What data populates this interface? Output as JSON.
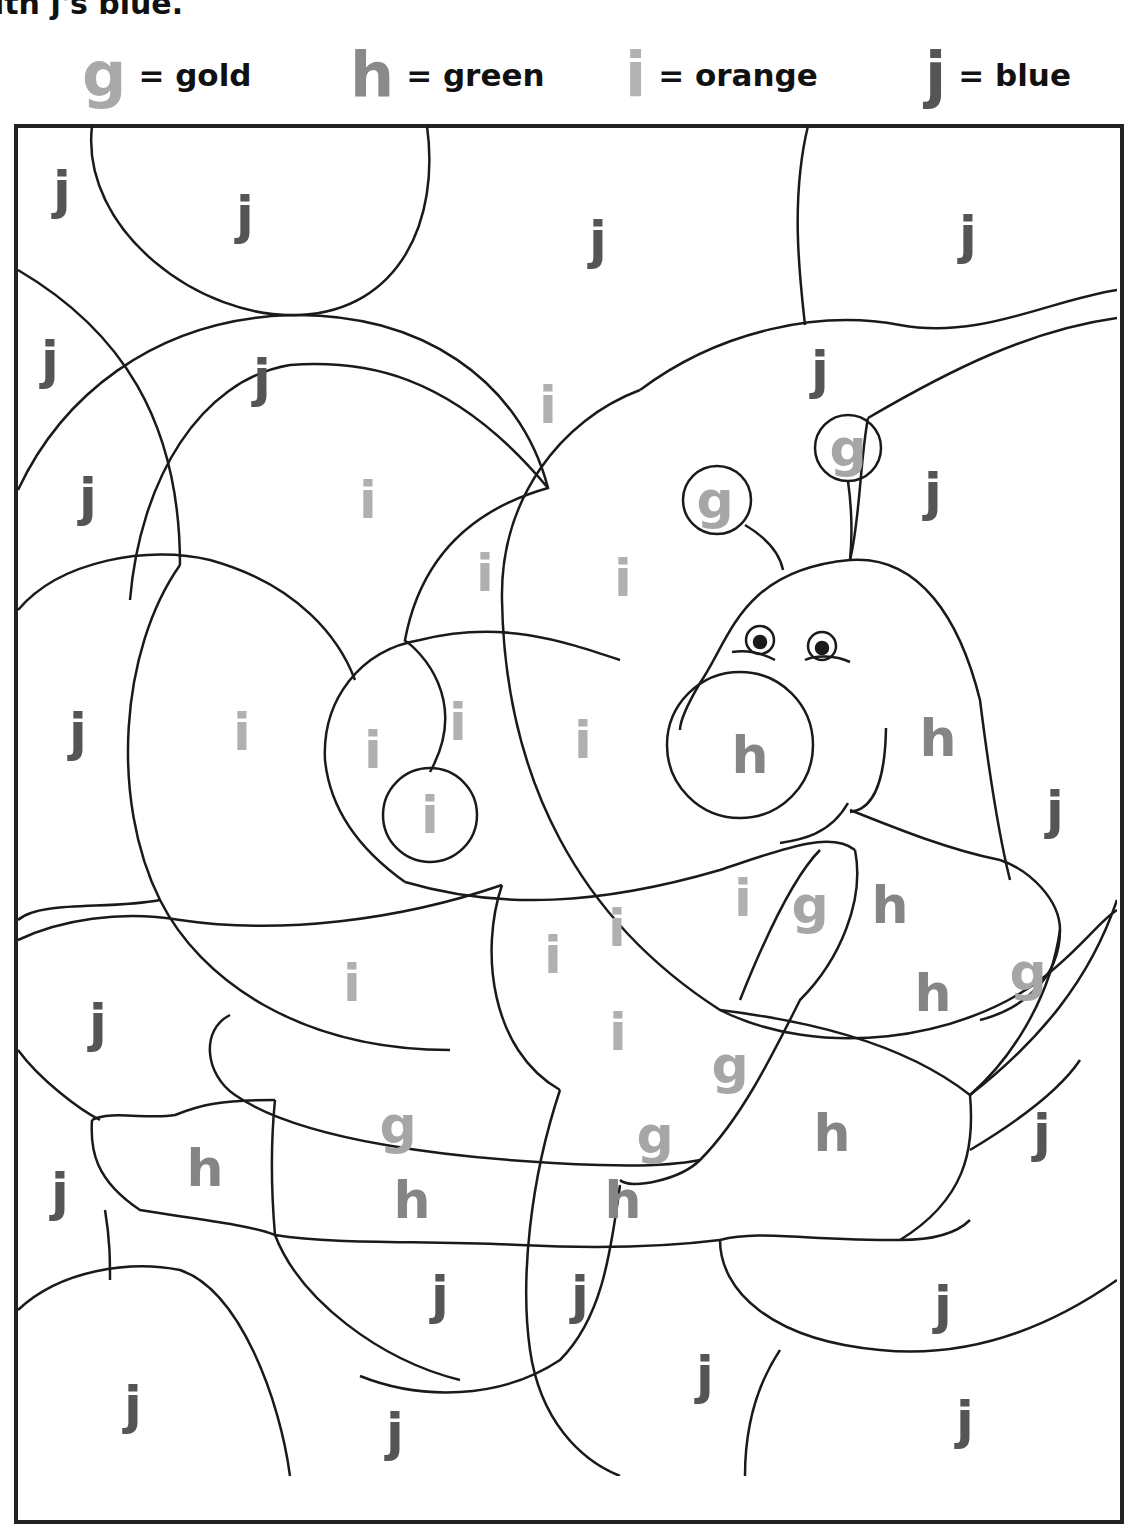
{
  "instruction": "ith j's blue.",
  "key": [
    {
      "letter": "g",
      "label": "= gold",
      "color": "#a9a9a9",
      "x": 82
    },
    {
      "letter": "h",
      "label": "= green",
      "color": "#8a8a8a",
      "x": 350
    },
    {
      "letter": "i",
      "label": "= orange",
      "color": "#b3b3b3",
      "x": 625
    },
    {
      "letter": "j",
      "label": "= blue",
      "color": "#555555",
      "x": 925
    }
  ],
  "colors": {
    "g": "#a6a6a6",
    "h": "#858585",
    "i": "#b0b0b0",
    "j": "#555555",
    "line": "#1a1a1a"
  },
  "labels": [
    {
      "l": "j",
      "x": 62,
      "y": 190
    },
    {
      "l": "j",
      "x": 245,
      "y": 215
    },
    {
      "l": "j",
      "x": 598,
      "y": 240
    },
    {
      "l": "j",
      "x": 968,
      "y": 235
    },
    {
      "l": "j",
      "x": 50,
      "y": 360
    },
    {
      "l": "j",
      "x": 262,
      "y": 378
    },
    {
      "l": "j",
      "x": 820,
      "y": 370
    },
    {
      "l": "i",
      "x": 548,
      "y": 405
    },
    {
      "l": "g",
      "x": 848,
      "y": 448
    },
    {
      "l": "g",
      "x": 715,
      "y": 500
    },
    {
      "l": "j",
      "x": 88,
      "y": 497
    },
    {
      "l": "i",
      "x": 368,
      "y": 500
    },
    {
      "l": "j",
      "x": 933,
      "y": 492
    },
    {
      "l": "i",
      "x": 485,
      "y": 573
    },
    {
      "l": "i",
      "x": 623,
      "y": 578
    },
    {
      "l": "j",
      "x": 78,
      "y": 732
    },
    {
      "l": "i",
      "x": 242,
      "y": 732
    },
    {
      "l": "i",
      "x": 373,
      "y": 750
    },
    {
      "l": "i",
      "x": 458,
      "y": 722
    },
    {
      "l": "i",
      "x": 583,
      "y": 740
    },
    {
      "l": "h",
      "x": 750,
      "y": 755
    },
    {
      "l": "h",
      "x": 938,
      "y": 738
    },
    {
      "l": "j",
      "x": 1055,
      "y": 810
    },
    {
      "l": "i",
      "x": 430,
      "y": 815
    },
    {
      "l": "i",
      "x": 743,
      "y": 898
    },
    {
      "l": "g",
      "x": 810,
      "y": 905
    },
    {
      "l": "h",
      "x": 890,
      "y": 905
    },
    {
      "l": "i",
      "x": 617,
      "y": 928
    },
    {
      "l": "i",
      "x": 553,
      "y": 955
    },
    {
      "l": "i",
      "x": 352,
      "y": 983
    },
    {
      "l": "h",
      "x": 933,
      "y": 993
    },
    {
      "l": "g",
      "x": 1028,
      "y": 972
    },
    {
      "l": "j",
      "x": 98,
      "y": 1023
    },
    {
      "l": "i",
      "x": 618,
      "y": 1032
    },
    {
      "l": "g",
      "x": 730,
      "y": 1065
    },
    {
      "l": "g",
      "x": 398,
      "y": 1125
    },
    {
      "l": "g",
      "x": 655,
      "y": 1135
    },
    {
      "l": "h",
      "x": 832,
      "y": 1133
    },
    {
      "l": "j",
      "x": 1042,
      "y": 1133
    },
    {
      "l": "h",
      "x": 205,
      "y": 1168
    },
    {
      "l": "j",
      "x": 60,
      "y": 1192
    },
    {
      "l": "h",
      "x": 412,
      "y": 1200
    },
    {
      "l": "h",
      "x": 623,
      "y": 1200
    },
    {
      "l": "j",
      "x": 440,
      "y": 1295
    },
    {
      "l": "j",
      "x": 580,
      "y": 1295
    },
    {
      "l": "j",
      "x": 943,
      "y": 1305
    },
    {
      "l": "j",
      "x": 133,
      "y": 1405
    },
    {
      "l": "j",
      "x": 705,
      "y": 1375
    },
    {
      "l": "j",
      "x": 395,
      "y": 1432
    },
    {
      "l": "j",
      "x": 965,
      "y": 1420
    }
  ]
}
